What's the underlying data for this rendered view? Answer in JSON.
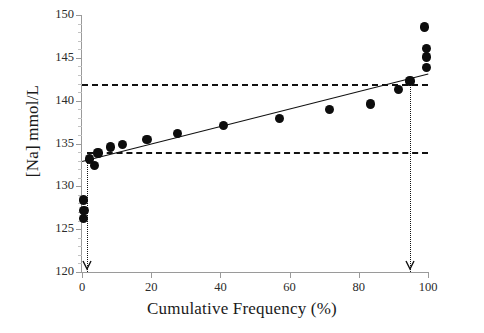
{
  "chart_data": {
    "type": "scatter",
    "title": "",
    "xlabel": "Cumulative Frequency (%)",
    "ylabel": "[Na] mmol/L",
    "xlim": [
      0,
      100
    ],
    "ylim": [
      120,
      150
    ],
    "xticks": [
      0,
      20,
      40,
      60,
      80,
      100
    ],
    "yticks": [
      120,
      125,
      130,
      135,
      140,
      145,
      150
    ],
    "grid": false,
    "legend": null,
    "points": [
      {
        "x": 0.4,
        "y": 128.4
      },
      {
        "x": 0.6,
        "y": 127.2
      },
      {
        "x": 0.5,
        "y": 126.2
      },
      {
        "x": 3.6,
        "y": 132.4
      },
      {
        "x": 2.2,
        "y": 133.2
      },
      {
        "x": 4.6,
        "y": 133.9
      },
      {
        "x": 8.2,
        "y": 134.6
      },
      {
        "x": 11.8,
        "y": 134.9
      },
      {
        "x": 18.8,
        "y": 135.5
      },
      {
        "x": 27.5,
        "y": 136.2
      },
      {
        "x": 41.0,
        "y": 137.1
      },
      {
        "x": 57.0,
        "y": 137.9
      },
      {
        "x": 71.5,
        "y": 139.0
      },
      {
        "x": 83.5,
        "y": 139.6
      },
      {
        "x": 91.5,
        "y": 141.3
      },
      {
        "x": 94.8,
        "y": 142.3
      },
      {
        "x": 99.5,
        "y": 143.9
      },
      {
        "x": 99.5,
        "y": 145.1
      },
      {
        "x": 99.5,
        "y": 146.1
      },
      {
        "x": 99.0,
        "y": 148.6
      }
    ],
    "trendline": {
      "x0": 0,
      "y0": 132.9,
      "x1": 100,
      "y1": 143.1
    },
    "reference_lines": {
      "upper_limit": {
        "y": 142.0,
        "style": "dashed",
        "x_from": 0,
        "x_to": 100
      },
      "lower_limit": {
        "y": 134.0,
        "style": "dashed",
        "x_from": 1.5,
        "x_to": 100
      },
      "left_marker": {
        "x": 1.5,
        "style": "dotted",
        "y_from": 120,
        "y_to": 134.0
      },
      "right_marker": {
        "x": 94.8,
        "style": "dotted",
        "y_from": 120,
        "y_to": 142.0
      }
    },
    "annotations": [
      {
        "name": "left-arrow",
        "x": 1.5,
        "y": 120,
        "glyph": "arrow-down"
      },
      {
        "name": "right-arrow",
        "x": 94.8,
        "y": 120,
        "glyph": "arrow-down"
      }
    ],
    "series_color": "#0d0d0d"
  },
  "axes": {
    "y_tick_labels": [
      "150",
      "145",
      "140",
      "135",
      "130",
      "125",
      "120"
    ],
    "x_tick_labels": [
      "0",
      "20",
      "40",
      "60",
      "80",
      "100"
    ]
  }
}
